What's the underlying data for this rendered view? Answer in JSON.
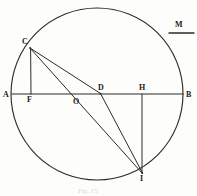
{
  "figure": {
    "caption": "Fig. 15",
    "stroke_color": "#2b2b2b",
    "label_color": "#1a1a1a",
    "background_color": "#fdfdfc",
    "labels": {
      "A": "A",
      "B": "B",
      "C": "C",
      "D": "D",
      "F": "F",
      "H": "H",
      "I": "I",
      "M": "M",
      "O": "O"
    },
    "geometry": {
      "circle": {
        "cx": 97,
        "cy": 94,
        "r": 86
      },
      "points": {
        "A": {
          "x": 12,
          "y": 94
        },
        "B": {
          "x": 183,
          "y": 94
        },
        "C": {
          "x": 30,
          "y": 48
        },
        "D": {
          "x": 100,
          "y": 94
        },
        "F": {
          "x": 31,
          "y": 94
        },
        "H": {
          "x": 142,
          "y": 94
        },
        "I": {
          "x": 142,
          "y": 173
        },
        "O": {
          "x": 77,
          "y": 94
        }
      },
      "segments": [
        {
          "name": "AB-diameter",
          "from": "A",
          "to": "B"
        },
        {
          "name": "CF-perpendicular",
          "from": "C",
          "to": "F"
        },
        {
          "name": "HI-perpendicular",
          "from": "H",
          "to": "I"
        },
        {
          "name": "CD-chord",
          "from": "C",
          "to": "D"
        },
        {
          "name": "CI-chord",
          "from": "C",
          "to": "I"
        },
        {
          "name": "DI-segment",
          "from": "D",
          "to": "I"
        }
      ],
      "tangent_mark": {
        "name": "M-segment",
        "x1": 169,
        "y1": 33,
        "x2": 194,
        "y2": 33
      }
    },
    "label_positions": {
      "A": {
        "x": 3,
        "y": 91
      },
      "B": {
        "x": 186,
        "y": 92
      },
      "C": {
        "x": 22,
        "y": 38
      },
      "D": {
        "x": 98,
        "y": 85
      },
      "F": {
        "x": 27,
        "y": 96
      },
      "H": {
        "x": 139,
        "y": 85
      },
      "I": {
        "x": 140,
        "y": 175
      },
      "M": {
        "x": 175,
        "y": 21
      },
      "O": {
        "x": 73,
        "y": 98
      }
    },
    "caption_position": {
      "x": 78,
      "y": 188
    }
  }
}
